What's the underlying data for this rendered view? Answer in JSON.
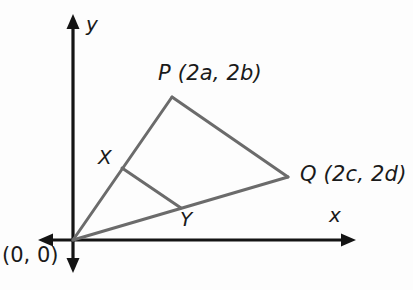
{
  "figure": {
    "type": "geometry-diagram",
    "background_color": "#fdfdfd",
    "axis_color": "#141414",
    "triangle_color": "#6b6b6b",
    "label_color": "#1a1a1a"
  },
  "axes": {
    "x_label": "x",
    "y_label": "y",
    "origin_label": "(0, 0)",
    "origin": {
      "x": 73,
      "y": 240
    },
    "x_axis": {
      "x1": 38,
      "y1": 240,
      "x2": 356,
      "y2": 240,
      "arrows": "both"
    },
    "y_axis": {
      "x1": 73,
      "y1": 14,
      "x2": 73,
      "y2": 273,
      "arrows": "both"
    }
  },
  "vertices": [
    {
      "name": "O",
      "label": "(0, 0)",
      "x": 73,
      "y": 240
    },
    {
      "name": "P",
      "label": "P (2a, 2b)",
      "x": 172,
      "y": 97
    },
    {
      "name": "Q",
      "label": "Q (2c, 2d)",
      "x": 288,
      "y": 177
    }
  ],
  "midpoints": [
    {
      "name": "X",
      "label": "X",
      "on_segment": "OP",
      "x": 122,
      "y": 168
    },
    {
      "name": "Y",
      "label": "Y",
      "on_segment": "OQ",
      "x": 181,
      "y": 208
    }
  ],
  "segments": [
    {
      "name": "OP",
      "from": "O",
      "to": "P"
    },
    {
      "name": "PQ",
      "from": "P",
      "to": "Q"
    },
    {
      "name": "OQ",
      "from": "O",
      "to": "Q"
    },
    {
      "name": "XY",
      "from": "X",
      "to": "Y"
    }
  ],
  "labels": {
    "P": "P (2a, 2b)",
    "Q": "Q (2c, 2d)",
    "X": "X",
    "Y": "Y",
    "x_axis": "x",
    "y_axis": "y",
    "origin": "(0, 0)"
  }
}
